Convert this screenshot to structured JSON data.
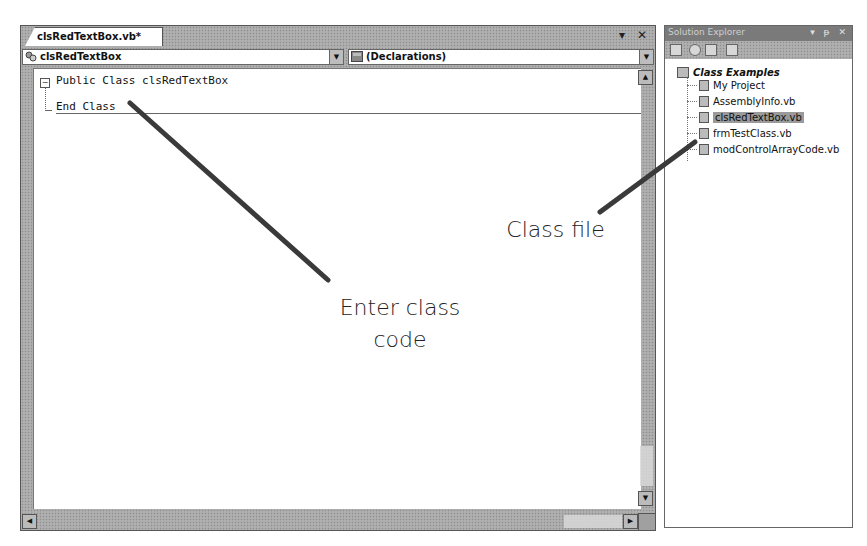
{
  "editor": {
    "tab_label": "clsRedTextBox.vb*",
    "tab_controls": {
      "dropdown": "▾",
      "close": "✕"
    },
    "class_combo": {
      "value": "clsRedTextBox",
      "icon": "class-icon"
    },
    "member_combo": {
      "value": "(Declarations)",
      "icon": "declarations-icon"
    },
    "code_lines": [
      "Public Class clsRedTextBox",
      "End Class"
    ],
    "scroll": {
      "up": "▲",
      "down": "▼",
      "left": "◀",
      "right": "▶"
    }
  },
  "solution_explorer": {
    "title": "Solution Explorer",
    "title_controls": {
      "dropdown": "▾",
      "pin": "ᵽ",
      "close": "✕"
    },
    "toolbar": [
      "properties-icon",
      "refresh-icon",
      "show-all-files-icon",
      "view-code-icon"
    ],
    "root": "Class Examples",
    "items": [
      {
        "label": "My Project",
        "icon": "my-project-icon"
      },
      {
        "label": "AssemblyInfo.vb",
        "icon": "vb-file-icon"
      },
      {
        "label": "clsRedTextBox.vb",
        "icon": "vb-file-icon",
        "selected": true
      },
      {
        "label": "frmTestClass.vb",
        "icon": "form-file-icon"
      },
      {
        "label": "modControlArrayCode.vb",
        "icon": "vb-file-icon"
      }
    ]
  },
  "callouts": {
    "enter_class_code_line1": "Enter class",
    "enter_class_code_line2": "code",
    "class_file": "Class file"
  },
  "colors": {
    "leader_line": "#3a3a3a",
    "selection": "#9a9a9a"
  }
}
